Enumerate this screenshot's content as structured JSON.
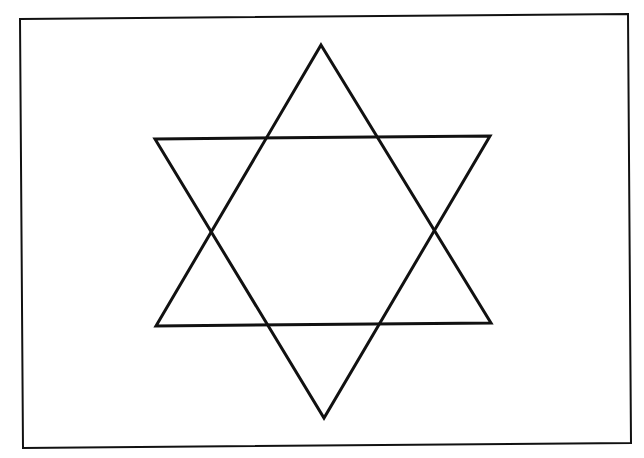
{
  "diagram": {
    "title": "",
    "background": "#ffffff",
    "stroke_color": "#111111",
    "frame": {
      "points": [
        [
          20,
          19
        ],
        [
          628,
          14
        ],
        [
          631,
          443
        ],
        [
          23,
          448
        ]
      ],
      "stroke_width": 2
    },
    "shape": "six-pointed star (hexagram)",
    "triangles": [
      {
        "name": "upward-triangle",
        "points": [
          [
            321,
            45
          ],
          [
            491,
            323
          ],
          [
            156,
            326
          ]
        ],
        "stroke_width": 3
      },
      {
        "name": "downward-triangle",
        "points": [
          [
            155,
            139
          ],
          [
            490,
            136
          ],
          [
            324,
            418
          ]
        ],
        "stroke_width": 3
      }
    ]
  }
}
